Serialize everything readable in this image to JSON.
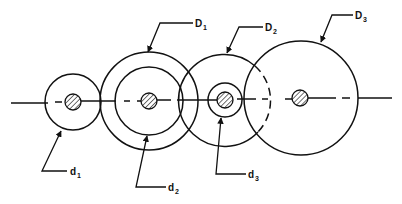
{
  "diagram": {
    "type": "gear train / pitch circle diagram",
    "stroke_color": "#111111",
    "background": "#ffffff",
    "center_line_y": 100,
    "labels": {
      "D1": {
        "main": "D",
        "sub": "1"
      },
      "D2": {
        "main": "D",
        "sub": "2"
      },
      "D3": {
        "main": "D",
        "sub": "3"
      },
      "d1": {
        "main": "d",
        "sub": "1"
      },
      "d2": {
        "main": "d",
        "sub": "2"
      },
      "d3": {
        "main": "d",
        "sub": "3"
      }
    },
    "circles": [
      {
        "name": "d1",
        "cx": 73,
        "cy": 100,
        "r": 29
      },
      {
        "name": "D1",
        "cx": 149,
        "cy": 100,
        "r": 49
      },
      {
        "name": "d2",
        "cx": 149,
        "cy": 100,
        "r": 34
      },
      {
        "name": "D2",
        "cx": 225,
        "cy": 100,
        "r": 46
      },
      {
        "name": "d3",
        "cx": 225,
        "cy": 100,
        "r": 17
      },
      {
        "name": "D3",
        "cx": 301,
        "cy": 100,
        "r": 57
      }
    ],
    "shafts": [
      {
        "cx": 73,
        "cy": 100,
        "r": 8
      },
      {
        "cx": 149,
        "cy": 100,
        "r": 8
      },
      {
        "cx": 225,
        "cy": 100,
        "r": 8
      },
      {
        "cx": 300,
        "cy": 100,
        "r": 8
      }
    ]
  }
}
